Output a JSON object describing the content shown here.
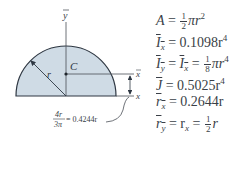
{
  "figure": {
    "colors": {
      "fill": "#cfdbe5",
      "outline": "#2e3742",
      "axis": "#4a4f57",
      "text": "#3a3f47"
    },
    "labels": {
      "y_bar_axis": "y",
      "x_bar_axis": "x",
      "x_axis": "x",
      "centroid": "C",
      "radius": "r",
      "offset_num": "4r",
      "offset_den": "3π",
      "offset_value": "= 0.4244r"
    }
  },
  "formulas": {
    "area": {
      "lhs": "A",
      "eq": " = ",
      "frac_num": "1",
      "frac_den": "2",
      "rhs": "πr",
      "exp": "2"
    },
    "ix_bar": {
      "lhs": "I",
      "sub": "x",
      "eq": " = 0.1098r",
      "exp": "4"
    },
    "iy_bar": {
      "lhs1": "I",
      "sub1": "y",
      "mid": " = ",
      "lhs2": "I",
      "sub2": "x",
      "eq": " = ",
      "frac_num": "1",
      "frac_den": "8",
      "rhs": "πr",
      "exp": "4"
    },
    "j_bar": {
      "lhs": "J",
      "eq": " = 0.5025r",
      "exp": "4"
    },
    "rx_bar": {
      "lhs": "r",
      "sub": "x",
      "eq": " = 0.2644r"
    },
    "ry_bar": {
      "lhs1": "r",
      "sub1": "y",
      "mid": " = r",
      "sub2": "x",
      "eq": " = ",
      "frac_num": "1",
      "frac_den": "2",
      "rhs": "r"
    }
  }
}
